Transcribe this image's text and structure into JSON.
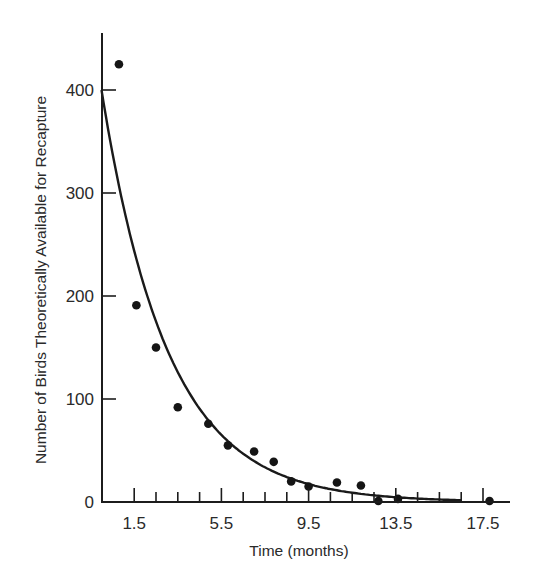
{
  "chart_data": {
    "type": "scatter",
    "title": "",
    "xlabel": "Time (months)",
    "ylabel": "Number of Birds Theoretically Available for Recapture",
    "xlim": [
      0,
      18.1
    ],
    "ylim": [
      0,
      450
    ],
    "grid": false,
    "legend": null,
    "x_tick_labels": [
      "1.5",
      "5.5",
      "9.5",
      "13.5",
      "17.5"
    ],
    "x_ticks_minor_every": 1,
    "y_tick_labels": [
      "0",
      "100",
      "200",
      "300",
      "400"
    ],
    "series": [
      {
        "name": "Observed recaptures",
        "type": "scatter",
        "points": [
          {
            "x": 0.8,
            "y": 425
          },
          {
            "x": 1.6,
            "y": 191
          },
          {
            "x": 2.5,
            "y": 150
          },
          {
            "x": 3.5,
            "y": 92
          },
          {
            "x": 4.9,
            "y": 76
          },
          {
            "x": 5.8,
            "y": 55
          },
          {
            "x": 7.0,
            "y": 49
          },
          {
            "x": 7.9,
            "y": 39
          },
          {
            "x": 8.7,
            "y": 20
          },
          {
            "x": 9.5,
            "y": 15
          },
          {
            "x": 10.8,
            "y": 19
          },
          {
            "x": 11.9,
            "y": 16
          },
          {
            "x": 12.7,
            "y": 1
          },
          {
            "x": 13.6,
            "y": 3
          },
          {
            "x": 17.8,
            "y": 1
          }
        ]
      },
      {
        "name": "Theoretical exponential decay",
        "type": "line",
        "model": "y = 400 * exp(-0.33 * t)",
        "y0": 400,
        "k": 0.33,
        "x_range": [
          0,
          16.5
        ]
      }
    ]
  },
  "axes": {
    "xlabel": "Time (months)",
    "ylabel": "Number of Birds Theoretically Available for Recapture"
  }
}
